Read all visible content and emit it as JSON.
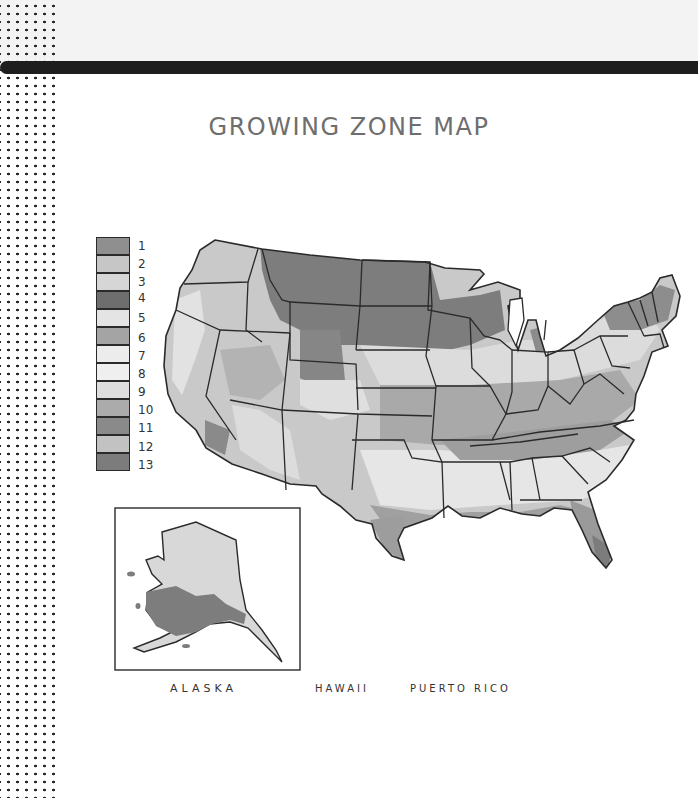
{
  "page": {
    "title": "GROWING ZONE MAP"
  },
  "legend": {
    "items": [
      {
        "label": "1",
        "color": "#8f8f8f"
      },
      {
        "label": "2",
        "color": "#c6c6c6"
      },
      {
        "label": "3",
        "color": "#d6d6d6"
      },
      {
        "label": "4",
        "color": "#6e6e6e"
      },
      {
        "label": "5",
        "color": "#e4e4e4"
      },
      {
        "label": "6",
        "color": "#a4a4a4"
      },
      {
        "label": "7",
        "color": "#ececec"
      },
      {
        "label": "8",
        "color": "#efefef"
      },
      {
        "label": "9",
        "color": "#dedede"
      },
      {
        "label": "10",
        "color": "#ababab"
      },
      {
        "label": "11",
        "color": "#8a8a8a"
      },
      {
        "label": "12",
        "color": "#c2c2c2"
      },
      {
        "label": "13",
        "color": "#7c7c7c"
      }
    ]
  },
  "insets": {
    "alaska": {
      "label": "ALASKA"
    },
    "hawaii": {
      "label": "HAWAII"
    },
    "puerto_rico": {
      "label": "PUERTO RICO"
    }
  },
  "colors": {
    "background": "#ffffff",
    "top_band": "#f3f3f3",
    "bar": "#1e1e1e",
    "outline": "#2a2a2a",
    "title": "#6e6e6e"
  }
}
